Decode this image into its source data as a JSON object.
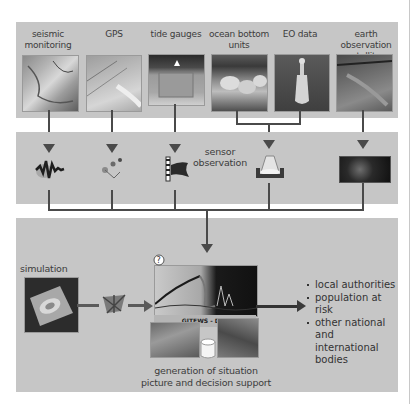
{
  "sources": [
    {
      "id": "seismic",
      "label_line1": "seismic",
      "label_line2": "monitoring",
      "icon": "seismogram-icon"
    },
    {
      "id": "gps",
      "label_line1": "GPS",
      "label_line2": "",
      "icon": "gps-buoy-icon"
    },
    {
      "id": "tide",
      "label_line1": "tide gauges",
      "label_line2": "",
      "icon": "tide-gauge-icon"
    },
    {
      "id": "ocean",
      "label_line1": "ocean bottom",
      "label_line2": "units",
      "icon": "ocean-bottom-unit-icon"
    },
    {
      "id": "eo",
      "label_line1": "EO data",
      "label_line2": "",
      "icon": "eo-data-icon"
    },
    {
      "id": "sat",
      "label_line1": "earth observation",
      "label_line2": "satellites",
      "icon": "satellite-image-icon"
    }
  ],
  "sensor_panel": {
    "label_line1": "sensor",
    "label_line2": "observation"
  },
  "simulation": {
    "label": "simulation"
  },
  "dss": {
    "brand": "GITEWS - DSS",
    "caption_line1": "generation of situation",
    "caption_line2": "picture and decision support"
  },
  "recipients": [
    "local authorities",
    "population at risk",
    "other national",
    "and international",
    "bodies"
  ],
  "colors": {
    "panel": "#c6c6c6",
    "line": "#4a4a4a",
    "background": "#ffffff"
  }
}
